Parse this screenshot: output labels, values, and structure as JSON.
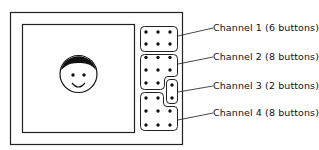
{
  "diagram": {
    "channels": [
      {
        "label": "Channel 1  (6 buttons)",
        "buttons": 6
      },
      {
        "label": "Channel 2  (8 buttons)",
        "buttons": 8
      },
      {
        "label": "Channel 3  (2 buttons)",
        "buttons": 2
      },
      {
        "label": "Channel 4  (8 buttons)",
        "buttons": 8
      }
    ],
    "screen_content": "smiley-face"
  }
}
